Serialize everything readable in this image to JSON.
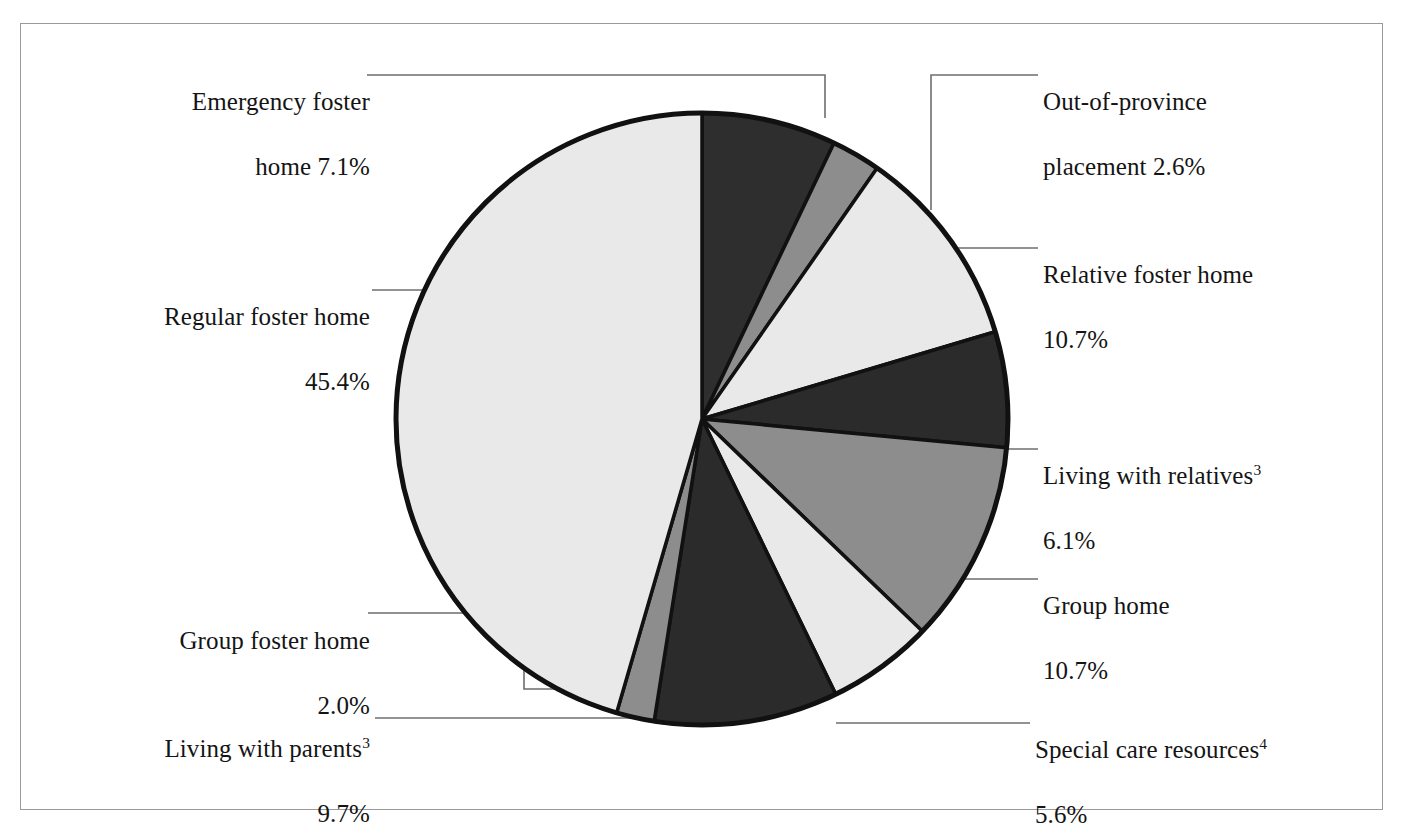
{
  "figure": {
    "type": "pie-chart",
    "frame_border_color": "#9a9a9a",
    "background_color": "#ffffff",
    "outline_color": "#111111"
  },
  "chart_data": {
    "type": "pie",
    "title": "",
    "xlabel": "",
    "ylabel": "",
    "units": "percent",
    "total": 99.9,
    "start_angle_deg": 0,
    "direction": "clockwise",
    "legend_position": "callout-labels",
    "grid": false,
    "categories": [
      "Emergency foster home",
      "Out-of-province placement",
      "Relative foster home",
      "Living with relatives",
      "Group home",
      "Special care resources",
      "Living with parents",
      "Group foster home",
      "Regular foster home"
    ],
    "values": [
      7.1,
      2.6,
      10.7,
      6.1,
      10.7,
      5.6,
      9.7,
      2.0,
      45.4
    ],
    "slices": [
      {
        "name": "emergency-foster-home",
        "label": "Emergency foster\nhome 7.1%",
        "label_line1": "Emergency foster",
        "label_line2": "home 7.1%",
        "category": "Emergency foster home",
        "value": 7.1,
        "value_text": "7.1%",
        "color": "#2e2e2e",
        "start_deg": 0,
        "end_deg": 25.56
      },
      {
        "name": "out-of-province-placement",
        "label": "Out-of-province\nplacement 2.6%",
        "label_line1": "Out-of-province",
        "label_line2": "placement 2.6%",
        "category": "Out-of-province placement",
        "value": 2.6,
        "value_text": "2.6%",
        "color": "#8d8d8d",
        "start_deg": 25.56,
        "end_deg": 34.92
      },
      {
        "name": "relative-foster-home",
        "label": "Relative foster home\n10.7%",
        "label_line1": "Relative foster home",
        "label_line2": "10.7%",
        "category": "Relative foster home",
        "value": 10.7,
        "value_text": "10.7%",
        "color": "#e9e9e9",
        "start_deg": 34.92,
        "end_deg": 73.44
      },
      {
        "name": "living-with-relatives",
        "label": "Living with relatives³\n6.1%",
        "label_line1": "Living with relatives",
        "label_line1_sup": "3",
        "label_line2": "6.1%",
        "category": "Living with relatives",
        "value": 6.1,
        "value_text": "6.1%",
        "color": "#2b2b2b",
        "start_deg": 73.44,
        "end_deg": 95.4
      },
      {
        "name": "group-home",
        "label": "Group home\n10.7%",
        "label_line1": "Group home",
        "label_line2": "10.7%",
        "category": "Group home",
        "value": 10.7,
        "value_text": "10.7%",
        "color": "#8d8d8d",
        "start_deg": 95.4,
        "end_deg": 133.92
      },
      {
        "name": "special-care-resources",
        "label": "Special care resources⁴\n5.6%",
        "label_line1": "Special care resources",
        "label_line1_sup": "4",
        "label_line2": "5.6%",
        "category": "Special care resources",
        "value": 5.6,
        "value_text": "5.6%",
        "color": "#e9e9e9",
        "start_deg": 133.92,
        "end_deg": 154.08
      },
      {
        "name": "living-with-parents",
        "label": "Living with parents³\n9.7%",
        "label_line1": "Living with parents",
        "label_line1_sup": "3",
        "label_line2": "9.7%",
        "category": "Living with parents",
        "value": 9.7,
        "value_text": "9.7%",
        "color": "#2b2b2b",
        "start_deg": 154.08,
        "end_deg": 189.0
      },
      {
        "name": "group-foster-home",
        "label": "Group foster home\n2.0%",
        "label_line1": "Group foster home",
        "label_line2": "2.0%",
        "category": "Group foster home",
        "value": 2.0,
        "value_text": "2.0%",
        "color": "#8d8d8d",
        "start_deg": 189.0,
        "end_deg": 196.2
      },
      {
        "name": "regular-foster-home",
        "label": "Regular foster home\n45.4%",
        "label_line1": "Regular foster home",
        "label_line2": "45.4%",
        "category": "Regular foster home",
        "value": 45.4,
        "value_text": "45.4%",
        "color": "#e9e9e9",
        "start_deg": 196.2,
        "end_deg": 360.0
      }
    ]
  }
}
